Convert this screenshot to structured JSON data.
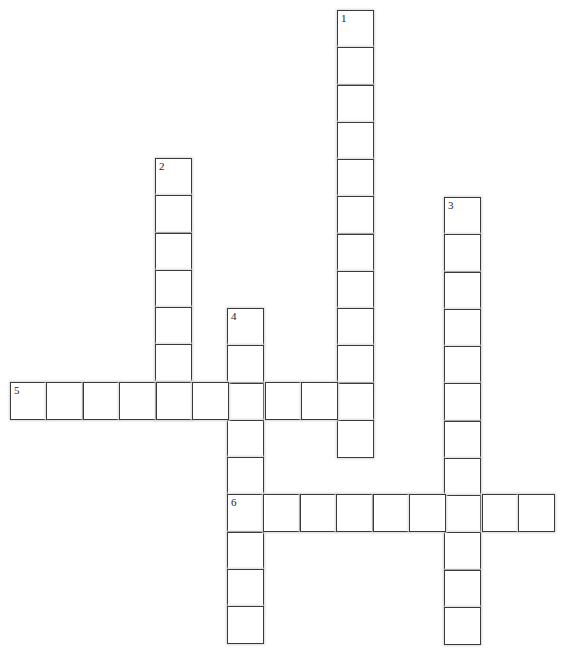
{
  "puzzle": {
    "cell_w": 36.4,
    "cell_h": 37.25,
    "entries": [
      {
        "number": "1",
        "direction": "down",
        "x": 337,
        "y": 10,
        "length": 12
      },
      {
        "number": "2",
        "direction": "down",
        "x": 155,
        "y": 158,
        "length": 7
      },
      {
        "number": "3",
        "direction": "down",
        "x": 444,
        "y": 197,
        "length": 12
      },
      {
        "number": "4",
        "direction": "down",
        "x": 227,
        "y": 308,
        "length": 9
      },
      {
        "number": "5",
        "direction": "across",
        "x": 10,
        "y": 382,
        "length": 10
      },
      {
        "number": "6",
        "direction": "across",
        "x": 227,
        "y": 494,
        "length": 9
      }
    ]
  }
}
